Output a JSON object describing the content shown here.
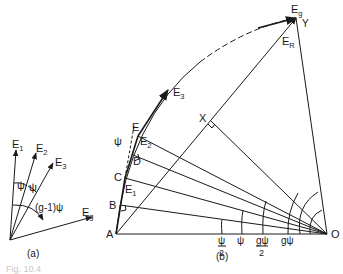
{
  "figure": {
    "panel_a": {
      "caption": "(a)",
      "vectors": [
        {
          "label": "E",
          "sub": "1"
        },
        {
          "label": "E",
          "sub": "2"
        },
        {
          "label": "E",
          "sub": "3"
        },
        {
          "label": "E",
          "sub": "g"
        }
      ],
      "angle_labels": [
        "ψ",
        "ψ",
        "(g-1)ψ"
      ]
    },
    "panel_b": {
      "caption": "(b)",
      "points": [
        "A",
        "B",
        "C",
        "D",
        "E",
        "X",
        "Y",
        "O"
      ],
      "vectors": [
        {
          "label": "E",
          "sub": "1"
        },
        {
          "label": "E",
          "sub": "2"
        },
        {
          "label": "E",
          "sub": "3"
        },
        {
          "label": "E",
          "sub": "g"
        },
        {
          "label": "E",
          "sub": "R"
        }
      ],
      "angle_labels": [
        {
          "num": "ψ",
          "den": "2"
        },
        {
          "num": "ψ",
          "den": ""
        },
        {
          "num": "gψ",
          "den": "2"
        },
        {
          "num": "gψ",
          "den": ""
        }
      ],
      "psi_mark": "ψ"
    },
    "bottom_caption": "Fig. 10.4"
  }
}
